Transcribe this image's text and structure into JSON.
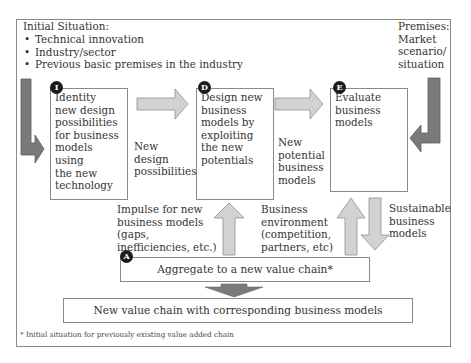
{
  "diagram": {
    "initial_situation": {
      "title": "Initial Situation:",
      "items": [
        "Technical innovation",
        "Industry/sector",
        "Previous basic premises in the industry"
      ]
    },
    "premises": {
      "line1": "Premises:",
      "line2": "Market",
      "line3": "scenario/",
      "line4": "situation"
    },
    "steps": [
      {
        "badge": "I",
        "lines": [
          "Identity",
          "new design",
          "possibilities",
          "for business",
          "models using",
          "the new",
          "technology"
        ]
      },
      {
        "badge": "D",
        "lines": [
          "Design new",
          "business",
          "models by",
          "exploiting",
          "the new",
          "potentials"
        ]
      },
      {
        "badge": "E",
        "lines": [
          "Evaluate",
          "business",
          "models"
        ]
      }
    ],
    "flow_labels": {
      "new_design": [
        "New",
        "design",
        "possibilities"
      ],
      "new_potential": [
        "New",
        "potential",
        "business",
        "models"
      ],
      "impulse": [
        "Impulse for new",
        "business models",
        "(gaps,",
        "inefficiencies, etc.)"
      ],
      "environment": [
        "Business",
        "environment",
        "(competition,",
        "partners, etc)"
      ],
      "sustainable": [
        "Sustainable",
        "business",
        "models"
      ]
    },
    "aggregate": {
      "badge": "A",
      "label": "Aggregate to a new value chain*"
    },
    "result": {
      "label": "New value chain with corresponding business models"
    },
    "footnote": "* Initial situation for previously existing value added chain"
  },
  "colors": {
    "border": "#8a8a8a",
    "arrow_light_fill": "#d2d2d2",
    "arrow_light_stroke": "#8f8f8f",
    "arrow_dark_fill": "#7a7a7a",
    "badge": "#1c1c1c"
  }
}
